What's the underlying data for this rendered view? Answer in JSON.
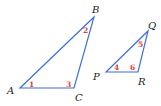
{
  "diagram": {
    "type": "similar-triangles",
    "colors": {
      "edge": "#3a6fd8",
      "angle_label": "#d9433c",
      "vertex_label": "#222222"
    },
    "triangles": [
      {
        "name": "ABC",
        "vertices": [
          {
            "label": "A",
            "x": 20,
            "y": 88
          },
          {
            "label": "B",
            "x": 94,
            "y": 17
          },
          {
            "label": "C",
            "x": 74,
            "y": 88
          }
        ],
        "angles": [
          {
            "label": "1",
            "at": "A"
          },
          {
            "label": "2",
            "at": "B"
          },
          {
            "label": "3",
            "at": "C"
          }
        ]
      },
      {
        "name": "PQR",
        "vertices": [
          {
            "label": "P",
            "x": 106,
            "y": 72
          },
          {
            "label": "Q",
            "x": 148,
            "y": 31
          },
          {
            "label": "R",
            "x": 138,
            "y": 72
          }
        ],
        "angles": [
          {
            "label": "4",
            "at": "P"
          },
          {
            "label": "5",
            "at": "Q"
          },
          {
            "label": "6",
            "at": "R"
          }
        ]
      }
    ]
  }
}
